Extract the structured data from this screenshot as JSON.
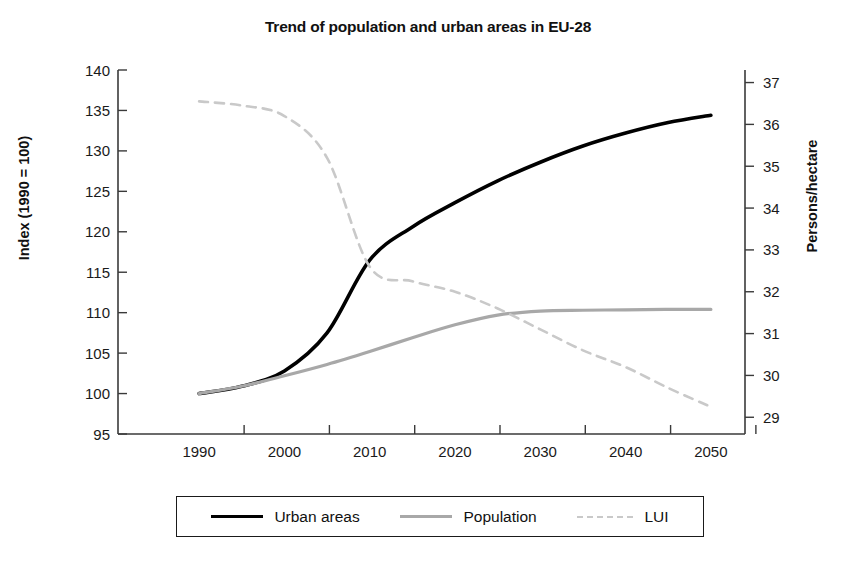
{
  "chart_data": {
    "type": "line",
    "title": "Trend of population and urban areas in EU-28",
    "xlabel": "",
    "ylabel": "Index (1990 = 100)",
    "ylabel_right": "Persons/hectare",
    "x": [
      1990,
      1995,
      2000,
      2005,
      2010,
      2015,
      2020,
      2025,
      2030,
      2035,
      2040,
      2045,
      2050
    ],
    "xlim": [
      1986,
      2054
    ],
    "xticks": [
      1990,
      2000,
      2010,
      2020,
      2030,
      2040,
      2050
    ],
    "xticklabels": [
      "1990",
      "2000",
      "2010",
      "2020",
      "2030",
      "2040",
      "2050"
    ],
    "ylim": [
      95,
      140
    ],
    "yticks": [
      95,
      100,
      105,
      110,
      115,
      120,
      125,
      130,
      135,
      140
    ],
    "yticklabels": [
      "95",
      "100",
      "105",
      "110",
      "115",
      "120",
      "125",
      "130",
      "135",
      "140"
    ],
    "ylim_right": [
      28.6,
      37.3
    ],
    "yticks_right": [
      29,
      30,
      31,
      32,
      33,
      34,
      35,
      36,
      37
    ],
    "yticklabels_right": [
      "29",
      "30",
      "31",
      "32",
      "33",
      "34",
      "35",
      "36",
      "37"
    ],
    "grid": false,
    "legend_position": "bottom",
    "series": [
      {
        "name": "Urban areas",
        "axis": "left",
        "style": "solid",
        "color": "#000000",
        "width": 3.6,
        "values": [
          100.0,
          100.9,
          102.8,
          107.5,
          116.5,
          120.6,
          123.6,
          126.3,
          128.6,
          130.6,
          132.2,
          133.5,
          134.4
        ]
      },
      {
        "name": "Population",
        "axis": "left",
        "style": "solid",
        "color": "#a8a8a8",
        "width": 3.2,
        "values": [
          100.0,
          100.9,
          102.2,
          103.6,
          105.2,
          106.9,
          108.5,
          109.7,
          110.2,
          110.3,
          110.35,
          110.4,
          110.4
        ]
      },
      {
        "name": "LUI",
        "axis": "right",
        "style": "dashed",
        "color": "#c9c9c9",
        "width": 2.6,
        "values": [
          36.55,
          36.45,
          36.2,
          35.2,
          32.6,
          32.25,
          32.0,
          31.6,
          31.1,
          30.6,
          30.2,
          29.7,
          29.25
        ]
      }
    ]
  },
  "legend": {
    "items": [
      {
        "label": "Urban areas",
        "swatch": "solid-dark"
      },
      {
        "label": "Population",
        "swatch": "solid-gray"
      },
      {
        "label": "LUI",
        "swatch": "dashed-light"
      }
    ]
  },
  "colors": {
    "urban": "#000000",
    "population": "#a8a8a8",
    "lui": "#c9c9c9",
    "axis": "#3a3a3a",
    "text": "#111111",
    "background": "#ffffff"
  }
}
